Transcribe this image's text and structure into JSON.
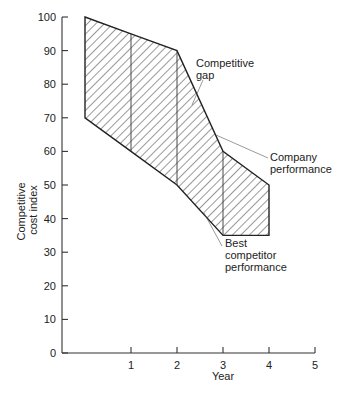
{
  "chart_data": {
    "type": "area",
    "title": "",
    "xlabel": "Year",
    "ylabel": "Competitive cost index",
    "ylabel_lines": [
      "Competitive",
      "cost index"
    ],
    "xlim": [
      0,
      5
    ],
    "ylim": [
      0,
      100
    ],
    "x_ticks": [
      1,
      2,
      3,
      4,
      5
    ],
    "y_ticks": [
      0,
      10,
      20,
      30,
      40,
      50,
      60,
      70,
      80,
      90,
      100
    ],
    "grid": false,
    "legend": null,
    "x": [
      0,
      1,
      2,
      3,
      4
    ],
    "series": [
      {
        "name": "Company performance",
        "values": [
          100,
          95,
          90,
          60,
          50
        ]
      },
      {
        "name": "Best competitor performance",
        "values": [
          70,
          60,
          50,
          35,
          35
        ]
      }
    ],
    "fill_between": {
      "label": "Competitive gap",
      "pattern": "diagonal hatch"
    },
    "annotations": [
      {
        "text": [
          "Competitive",
          "gap"
        ],
        "points_to": "hatched region near year 2.3"
      },
      {
        "text": [
          "Company",
          "performance"
        ],
        "points_to": "upper boundary near year 2.7"
      },
      {
        "text": [
          "Best",
          "competitor",
          "performance"
        ],
        "points_to": "lower boundary near year 2.5"
      }
    ]
  },
  "labels": {
    "xlabel": "Year",
    "ylabel_line1": "Competitive",
    "ylabel_line2": "cost index",
    "gap_line1": "Competitive",
    "gap_line2": "gap",
    "company_line1": "Company",
    "company_line2": "performance",
    "competitor_line1": "Best",
    "competitor_line2": "competitor",
    "competitor_line3": "performance"
  },
  "colors": {
    "ink": "#333333",
    "background": "#ffffff"
  }
}
